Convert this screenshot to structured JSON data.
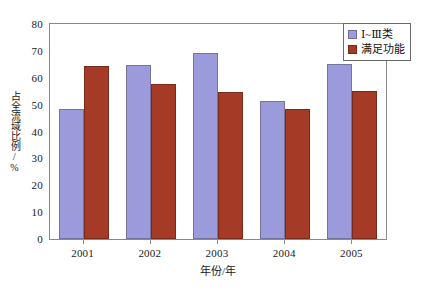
{
  "chart_data": {
    "type": "bar",
    "title": "",
    "subtitle": "",
    "xlabel": "年份/年",
    "ylabel": "占全流域比例/%",
    "categories": [
      "2001",
      "2002",
      "2003",
      "2004",
      "2005"
    ],
    "series": [
      {
        "name": "Ⅰ~Ⅲ类",
        "color": "#9b9bdb",
        "values": [
          48.5,
          64.8,
          69.2,
          51.5,
          65.2
        ]
      },
      {
        "name": "满足功能",
        "color": "#a53b27",
        "values": [
          64.3,
          57.8,
          54.7,
          48.5,
          55.1
        ]
      }
    ],
    "ylim": [
      0,
      80
    ],
    "ytick_labels": [
      "80",
      "70",
      "60",
      "50",
      "40",
      "30",
      "20",
      "10",
      "0"
    ],
    "ytick_values": [
      80,
      70,
      60,
      50,
      40,
      30,
      20,
      10,
      0
    ],
    "ytick_step": 10,
    "grid": false,
    "legend_position": "top-right",
    "frame": "box"
  },
  "legend": {
    "items": [
      {
        "label": "Ⅰ~Ⅲ类",
        "color": "#9b9bdb"
      },
      {
        "label": "满足功能",
        "color": "#a53b27"
      }
    ]
  },
  "axes": {
    "y_title": "占全流域比例/%",
    "x_title": "年份/年"
  },
  "colors": {
    "series_a": "#9b9bdb",
    "series_b": "#a53b27",
    "frame": "#8a8a8a",
    "background": "#ffffff",
    "text": "#1a1a1a"
  }
}
